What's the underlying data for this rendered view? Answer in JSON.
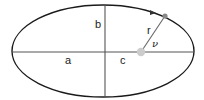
{
  "diagram": {
    "colors": {
      "ellipse": "#1a1a1a",
      "axes": "#444444",
      "radius_line": "#666666",
      "focus": "#cccccc",
      "body": "#888888",
      "label": "#222222"
    },
    "ellipse": {
      "cx": 103,
      "cy": 51,
      "rx": 91,
      "ry": 46
    },
    "focus": {
      "cx": 141,
      "cy": 52,
      "r": 4
    },
    "orbiting_body": {
      "cx": 165,
      "cy": 16,
      "r": 2.5
    },
    "labels": {
      "semi_minor": "b",
      "semi_major": "a",
      "focal_distance": "c",
      "radius": "r",
      "true_anomaly": "ν"
    }
  }
}
